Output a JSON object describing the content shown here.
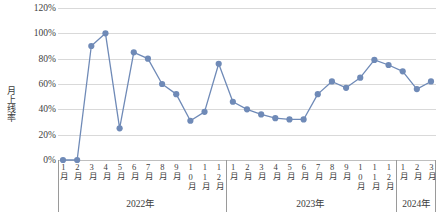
{
  "chart_data": {
    "type": "line",
    "title": "",
    "xlabel": "",
    "ylabel": "月上线率",
    "ylim": [
      0,
      1.2
    ],
    "ytick_labels": [
      "120%",
      "100%",
      "80%",
      "60%",
      "40%",
      "20%",
      "0%"
    ],
    "ytick_values": [
      1.2,
      1.0,
      0.8,
      0.6,
      0.4,
      0.2,
      0.0
    ],
    "grid": true,
    "legend": "none",
    "series_color": "#6f8ab7",
    "marker": "circle",
    "categories": [
      "1月",
      "2月",
      "3月",
      "4月",
      "5月",
      "6月",
      "7月",
      "8月",
      "9月",
      "10月",
      "11月",
      "12月",
      "1月",
      "2月",
      "3月",
      "4月",
      "5月",
      "6月",
      "7月",
      "8月",
      "9月",
      "10月",
      "11月",
      "12月",
      "1月",
      "2月",
      "3月"
    ],
    "groups": [
      {
        "label": "2022年",
        "start": 0,
        "count": 12
      },
      {
        "label": "2023年",
        "start": 12,
        "count": 12
      },
      {
        "label": "2024年",
        "start": 24,
        "count": 3
      }
    ],
    "series": [
      {
        "name": "月上线率",
        "values": [
          0,
          0,
          0.9,
          1.0,
          0.25,
          0.85,
          0.8,
          0.6,
          0.52,
          0.31,
          0.38,
          0.76,
          0.46,
          0.4,
          0.36,
          0.33,
          0.32,
          0.32,
          0.52,
          0.62,
          0.57,
          0.65,
          0.79,
          0.75,
          0.7,
          0.56,
          0.62
        ]
      }
    ]
  }
}
